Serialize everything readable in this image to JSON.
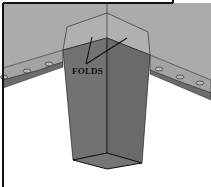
{
  "diagram": {
    "labels": {
      "folds": "FOLDS"
    },
    "colors": {
      "background": "#ffffff",
      "surface": "#ababab",
      "surface_edge_band": "#a3a3a3",
      "surface_underside": "#6c6c6c",
      "leg_face_left": "#717171",
      "leg_face_right": "#6a6a6a",
      "leg_bottom": "#747474",
      "leg_top_outline_fill": "#b2b2b2",
      "line": "#1a1a1a",
      "frame": "#111111"
    },
    "rivets_left_count": 4,
    "rivets_right_count": 3
  }
}
